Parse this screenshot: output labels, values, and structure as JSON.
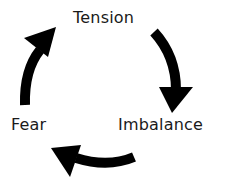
{
  "diagram": {
    "type": "cycle",
    "nodes": [
      {
        "id": "tension",
        "label": "Tension"
      },
      {
        "id": "imbalance",
        "label": "Imbalance"
      },
      {
        "id": "fear",
        "label": "Fear"
      }
    ],
    "edges": [
      {
        "from": "tension",
        "to": "imbalance",
        "direction": "clockwise"
      },
      {
        "from": "imbalance",
        "to": "fear",
        "direction": "clockwise"
      },
      {
        "from": "fear",
        "to": "tension",
        "direction": "clockwise"
      }
    ],
    "colors": {
      "arrow": "#000000",
      "text": "#1a1a1a",
      "background": "#ffffff"
    }
  }
}
